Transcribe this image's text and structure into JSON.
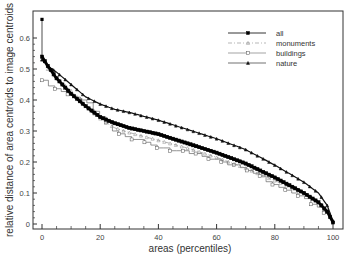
{
  "chart_data": {
    "type": "line",
    "title": "",
    "xlabel": "areas (percentiles)",
    "ylabel": "relative distance of area centroids to image centroids",
    "xlim": [
      -2,
      104
    ],
    "ylim": [
      -0.02,
      0.7
    ],
    "xticks": [
      0,
      20,
      40,
      60,
      80,
      100
    ],
    "yticks": [
      0,
      0.1,
      0.2,
      0.3,
      0.4,
      0.5,
      0.6
    ],
    "grid": false,
    "legend_position": "upper right",
    "x": [
      0,
      2,
      5,
      10,
      15,
      20,
      25,
      30,
      40,
      50,
      60,
      70,
      80,
      90,
      95,
      98,
      100
    ],
    "series": [
      {
        "name": "all",
        "marker": "filled-square",
        "style": "solid",
        "values": [
          0.54,
          0.51,
          0.47,
          0.42,
          0.38,
          0.345,
          0.325,
          0.31,
          0.29,
          0.26,
          0.23,
          0.195,
          0.15,
          0.1,
          0.07,
          0.04,
          0.005
        ],
        "outlier": {
          "x": 0,
          "y": 0.66
        }
      },
      {
        "name": "monuments",
        "marker": "open-triangle",
        "style": "dash-dot",
        "values": [
          0.53,
          0.5,
          0.47,
          0.43,
          0.38,
          0.34,
          0.31,
          0.295,
          0.27,
          0.245,
          0.215,
          0.18,
          0.14,
          0.1,
          0.07,
          0.045,
          0.01
        ]
      },
      {
        "name": "buildings",
        "marker": "open-square",
        "style": "solid-thin",
        "values": [
          0.46,
          0.45,
          0.435,
          0.41,
          0.39,
          0.345,
          0.29,
          0.28,
          0.245,
          0.23,
          0.205,
          0.175,
          0.125,
          0.08,
          0.055,
          0.03,
          0.01
        ]
      },
      {
        "name": "nature",
        "marker": "filled-triangle",
        "style": "solid",
        "values": [
          0.53,
          0.51,
          0.49,
          0.45,
          0.41,
          0.387,
          0.37,
          0.36,
          0.335,
          0.305,
          0.275,
          0.24,
          0.19,
          0.135,
          0.1,
          0.06,
          0.01
        ]
      }
    ]
  },
  "legend": {
    "items": [
      "all",
      "monuments",
      "buildings",
      "nature"
    ]
  },
  "axes": {
    "xlabel": "areas (percentiles)",
    "ylabel": "relative distance of area centroids to image centroids",
    "xtick_labels": [
      "0",
      "20",
      "40",
      "60",
      "80",
      "100"
    ],
    "ytick_labels": [
      "0",
      "0.1",
      "0.2",
      "0.3",
      "0.4",
      "0.5",
      "0.6"
    ]
  }
}
